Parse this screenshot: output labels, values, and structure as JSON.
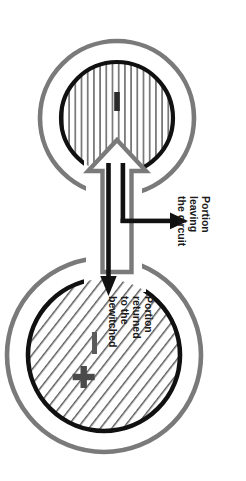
{
  "diagram": {
    "orientation_degrees": 90,
    "background_color": "#ffffff",
    "ring_color": "#7a7a7a",
    "core_color": "#1a1a1a",
    "hollow_arrow_color": "#7a7a7a",
    "flow_arrow_color": "#111111",
    "nodes": [
      {
        "id": "source-node",
        "name": "vertically-hatched-circle",
        "hatch": "vertical",
        "marks": [
          "minus"
        ],
        "ring": true
      },
      {
        "id": "bewitched-node",
        "name": "diagonally-hatched-circle",
        "hatch": "diagonal",
        "marks": [
          "minus",
          "plus"
        ],
        "ring": true
      }
    ],
    "labels": {
      "leaving": {
        "lines": [
          "Portion",
          "leaving",
          "the circuit"
        ],
        "line1": "Portion",
        "line2": "leaving",
        "line3": "the circuit"
      },
      "returned": {
        "lines": [
          "Portion",
          "returned",
          "to the",
          "bewitched"
        ],
        "line1": "Portion",
        "line2": "returned",
        "line3": "to the",
        "line4": "bewitched"
      }
    },
    "icons": {
      "hollow_arrow": "hollow-arrow-up-icon",
      "return_arrow": "arrow-down-icon",
      "exit_arrow": "arrow-right-icon",
      "plus_mark": "plus-icon",
      "minus_mark": "minus-icon"
    }
  }
}
